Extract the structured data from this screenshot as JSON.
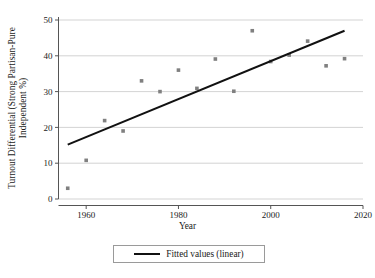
{
  "chart_data": {
    "type": "scatter",
    "title": "",
    "xlabel": "Year",
    "ylabel_line1": "Turnout Differential (Strong Partisan-Pure",
    "ylabel_line2": "Independent %)",
    "ylabel": "Turnout Differential (Strong Partisan-Pure Independent %)",
    "xlim": [
      1954,
      2020
    ],
    "ylim": [
      0,
      50
    ],
    "xticks": [
      1960,
      1980,
      2000,
      2020
    ],
    "xtick_labels": [
      "1960",
      "1980",
      "2000",
      "2020"
    ],
    "yticks": [
      0,
      10,
      20,
      30,
      40,
      50
    ],
    "ytick_labels": [
      "0",
      "10",
      "20",
      "30",
      "40",
      "50"
    ],
    "grid": "horizontal",
    "legend_position": "below-axes",
    "marker_color": "#808080",
    "line_color": "#111111",
    "grid_color": "#c8c8c8",
    "axis_color": "#555555",
    "series": [
      {
        "name": "Observed",
        "type": "scatter",
        "x": [
          1956,
          1960,
          1964,
          1968,
          1972,
          1976,
          1980,
          1984,
          1988,
          1992,
          1996,
          2000,
          2004,
          2008,
          2012,
          2016
        ],
        "y": [
          3.0,
          10.8,
          21.9,
          19.0,
          33.0,
          30.0,
          36.0,
          30.9,
          39.1,
          30.1,
          47.0,
          38.4,
          40.2,
          44.1,
          37.2,
          39.2
        ]
      },
      {
        "name": "Fitted values (linear)",
        "type": "line",
        "x": [
          1956,
          2016
        ],
        "y": [
          15.2,
          47.0
        ]
      }
    ],
    "legend": [
      {
        "label": "Fitted values (linear)",
        "marker": "line",
        "color": "#111111"
      }
    ]
  },
  "legend_panel": {
    "entry_label": "Fitted values (linear)"
  },
  "axes": {
    "x_title": "Year"
  }
}
